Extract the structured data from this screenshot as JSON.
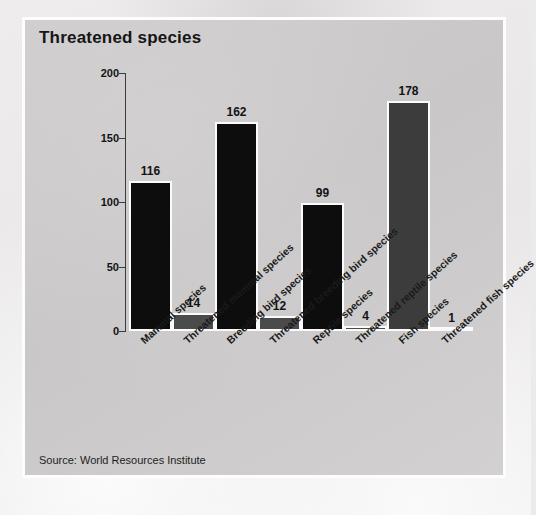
{
  "panel": {
    "title": "Threatened species",
    "source": "Source: World Resources Institute"
  },
  "chart_data": {
    "type": "bar",
    "title": "Threatened species",
    "xlabel": "",
    "ylabel": "",
    "ylim": [
      0,
      200
    ],
    "yticks": [
      0,
      50,
      100,
      150,
      200
    ],
    "grid": false,
    "legend": false,
    "categories": [
      "Mammal species",
      "Threatened mammal species",
      "Breeding bird species",
      "Threatened breeding bird species",
      "Reptile species",
      "Threatened reptile species",
      "Fish species",
      "Threatened fish species"
    ],
    "values": [
      116,
      14,
      162,
      12,
      99,
      4,
      178,
      1
    ],
    "bar_colors": [
      "#0d0d0d",
      "#4b4b4b",
      "#0d0d0d",
      "#4b4b4b",
      "#0d0d0d",
      "#4b4b4b",
      "#3c3c3c",
      "#bdbbbb"
    ],
    "value_labels": [
      "116",
      "14",
      "162",
      "12",
      "99",
      "4",
      "178",
      "1"
    ],
    "source": "Source: World Resources Institute"
  },
  "colors": {
    "panel_bg": "#cdcbcb",
    "page_bg": "#ecebeb",
    "panel_border": "#fdfdfd",
    "axis": "#3c3c3c",
    "text": "#131313",
    "primary_bar": "#0d0d0d",
    "secondary_bar": "#4b4b4b"
  }
}
